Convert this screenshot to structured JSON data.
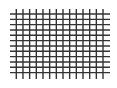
{
  "figure": {
    "type": "grid",
    "width": 117,
    "height": 88,
    "background": "#ffffff",
    "line_color": "#333333",
    "line_width": 1.4,
    "horizontal_lines": {
      "count": 12,
      "y_start": 14,
      "spacing": 5.33,
      "x_from": 10,
      "x_to": 110
    },
    "vertical_lines": {
      "count": 14,
      "x_start": 16.3,
      "spacing": 6.67,
      "y_from": 9,
      "y_to": 79
    }
  }
}
